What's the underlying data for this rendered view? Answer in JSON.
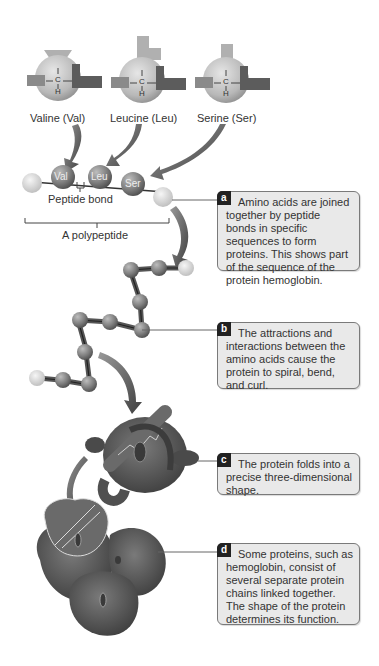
{
  "amino_acids": [
    {
      "name": "Valine (Val)",
      "abbr": "Val"
    },
    {
      "name": "Leucine (Leu)",
      "abbr": "Leu"
    },
    {
      "name": "Serine (Ser)",
      "abbr": "Ser"
    }
  ],
  "atoms": {
    "carbon": "C",
    "hydrogen": "H"
  },
  "labels": {
    "peptide_bond": "Peptide bond",
    "polypeptide": "A polypeptide"
  },
  "callouts": [
    {
      "letter": "a",
      "text": "Amino acids are joined together by peptide bonds in specific sequences to form proteins. This shows part of the sequence of the protein hemoglobin."
    },
    {
      "letter": "b",
      "text": "The attractions and interactions between the amino acids cause the protein to spiral, bend, and curl."
    },
    {
      "letter": "c",
      "text": "The protein folds into a precise three-dimensional shape."
    },
    {
      "letter": "d",
      "text": "Some proteins, such as hemoglobin, consist of several separate protein chains linked together. The shape of the protein determines its function."
    }
  ],
  "colors": {
    "sphere_light": "#c8c8c8",
    "sphere_dark": "#7a7a7a",
    "bead": "#8a8a8a",
    "protein": "#5a5a5a",
    "arrow": "#555555",
    "callout_bg": "#e9e9e9",
    "badge_bg": "#222222"
  }
}
